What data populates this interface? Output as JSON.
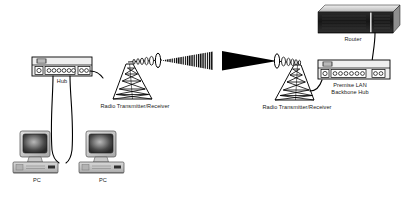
{
  "diagram": {
    "background_color": "#ffffff",
    "line_color": "#000000",
    "device_fill": "#e8e8e8",
    "screen_color": "#2b2b2b",
    "beam_color": "#000000"
  },
  "labels": {
    "hub": "Hub",
    "pc_left": "PC",
    "pc_right": "PC",
    "radio_left": "Radio Transmitter/Receiver",
    "radio_right": "Radio Transmitter/Receiver",
    "premise_lan": "Premise LAN",
    "backbone_hub": "Backbone Hub",
    "router": "Router"
  },
  "nodes": [
    {
      "id": "hub-left",
      "name": "Hub",
      "type": "hub",
      "ports": 6,
      "aux_ports": 2
    },
    {
      "id": "pc-left",
      "name": "PC",
      "type": "workstation"
    },
    {
      "id": "pc-right",
      "name": "PC",
      "type": "workstation"
    },
    {
      "id": "tower-left",
      "name": "Radio Transmitter/Receiver",
      "type": "radio-tower"
    },
    {
      "id": "tower-right",
      "name": "Radio Transmitter/Receiver",
      "type": "radio-tower"
    },
    {
      "id": "hub-right",
      "name": "Premise LAN Backbone Hub",
      "type": "hub",
      "ports": 6,
      "aux_ports": 2
    },
    {
      "id": "router",
      "name": "Router",
      "type": "router"
    }
  ],
  "links": [
    {
      "from": "hub-left",
      "to": "pc-left",
      "media": "cable"
    },
    {
      "from": "hub-left",
      "to": "pc-right",
      "media": "cable"
    },
    {
      "from": "hub-left",
      "to": "tower-left",
      "media": "cable"
    },
    {
      "from": "tower-left",
      "to": "tower-right",
      "media": "wireless-beam"
    },
    {
      "from": "tower-right",
      "to": "hub-right",
      "media": "cable"
    },
    {
      "from": "hub-right",
      "to": "router",
      "media": "cable"
    }
  ]
}
